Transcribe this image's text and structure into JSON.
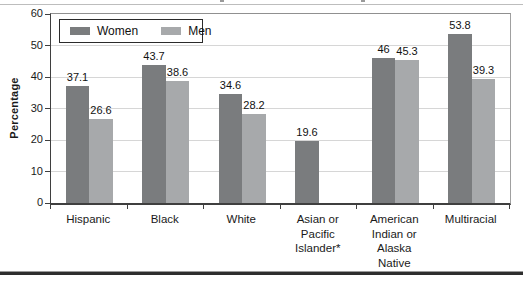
{
  "chart_data": {
    "type": "bar",
    "title": "",
    "ylabel": "Percentage",
    "xlabel": "",
    "ylim": [
      0,
      60
    ],
    "yticks": [
      0,
      10,
      20,
      30,
      40,
      50,
      60
    ],
    "grid": true,
    "legend_position": "top-left",
    "categories": [
      "Hispanic",
      "Black",
      "White",
      "Asian or Pacific Islander*",
      "American Indian or Alaska Native",
      "Multiracial"
    ],
    "category_label_lines": [
      [
        "Hispanic"
      ],
      [
        "Black"
      ],
      [
        "White"
      ],
      [
        "Asian or",
        "Pacific",
        "Islander*"
      ],
      [
        "American",
        "Indian or",
        "Alaska",
        "Native"
      ],
      [
        "Multiracial"
      ]
    ],
    "series": [
      {
        "name": "Women",
        "color": "#7a7c7e",
        "values": [
          37.1,
          43.7,
          34.6,
          19.6,
          46,
          53.8
        ],
        "value_labels": [
          "37.1",
          "43.7",
          "34.6",
          "19.6",
          "46",
          "53.8"
        ]
      },
      {
        "name": "Men",
        "color": "#a7a9ab",
        "values": [
          26.6,
          38.6,
          28.2,
          null,
          45.3,
          39.3
        ],
        "value_labels": [
          "26.6",
          "38.6",
          "28.2",
          "",
          "45.3",
          "39.3"
        ]
      }
    ],
    "colors": {
      "gridline": "#d6d6d6",
      "axis": "#3f3f3f",
      "text": "#1a1a1a"
    }
  }
}
